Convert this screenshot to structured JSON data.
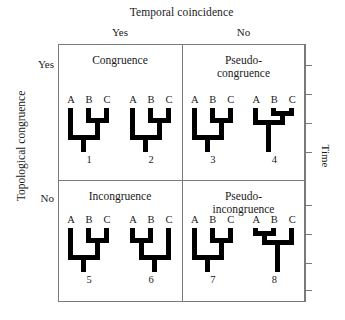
{
  "figure": {
    "column_axis_title": "Temporal coincidence",
    "row_axis_title": "Topological congruence",
    "time_axis_label": "Time",
    "column_headers": [
      "Yes",
      "No"
    ],
    "row_headers": [
      "Yes",
      "No"
    ],
    "taxa_labels": [
      "A",
      "B",
      "C"
    ],
    "colors": {
      "lines": "#7a7a7a",
      "trees": "#000000",
      "text": "#1a1a1a",
      "background": "#ffffff"
    }
  },
  "cells": [
    {
      "name": "congruence",
      "label_line1": "Congruence",
      "label_line2": "",
      "column": "Yes",
      "row": "Yes",
      "trees": [
        {
          "number": "1",
          "topology": "(A,(B,C))",
          "taxa": [
            "A",
            "B",
            "C"
          ]
        },
        {
          "number": "2",
          "topology": "(A,(B,C))",
          "taxa": [
            "A",
            "B",
            "C"
          ]
        }
      ]
    },
    {
      "name": "pseudo-congruence",
      "label_line1": "Pseudo-",
      "label_line2": "congruence",
      "column": "No",
      "row": "Yes",
      "trees": [
        {
          "number": "3",
          "topology": "(A,(B,C))",
          "taxa": [
            "A",
            "B",
            "C"
          ]
        },
        {
          "number": "4",
          "topology": "(A,(B,C))",
          "taxa": [
            "A",
            "B",
            "C"
          ]
        }
      ]
    },
    {
      "name": "incongruence",
      "label_line1": "Incongruence",
      "label_line2": "",
      "column": "Yes",
      "row": "No",
      "trees": [
        {
          "number": "5",
          "topology": "(A,(B,C))",
          "taxa": [
            "A",
            "B",
            "C"
          ]
        },
        {
          "number": "6",
          "topology": "((A,B),C)",
          "taxa": [
            "A",
            "B",
            "C"
          ]
        }
      ]
    },
    {
      "name": "pseudo-incongruence",
      "label_line1": "Pseudo-",
      "label_line2": "incongruence",
      "column": "No",
      "row": "No",
      "trees": [
        {
          "number": "7",
          "topology": "(A,(B,C))",
          "taxa": [
            "A",
            "B",
            "C"
          ]
        },
        {
          "number": "8",
          "topology": "((A,B),C)",
          "taxa": [
            "A",
            "B",
            "C"
          ]
        }
      ]
    }
  ],
  "time_ticks": [
    65,
    94,
    123,
    152,
    205,
    234,
    263,
    290
  ]
}
